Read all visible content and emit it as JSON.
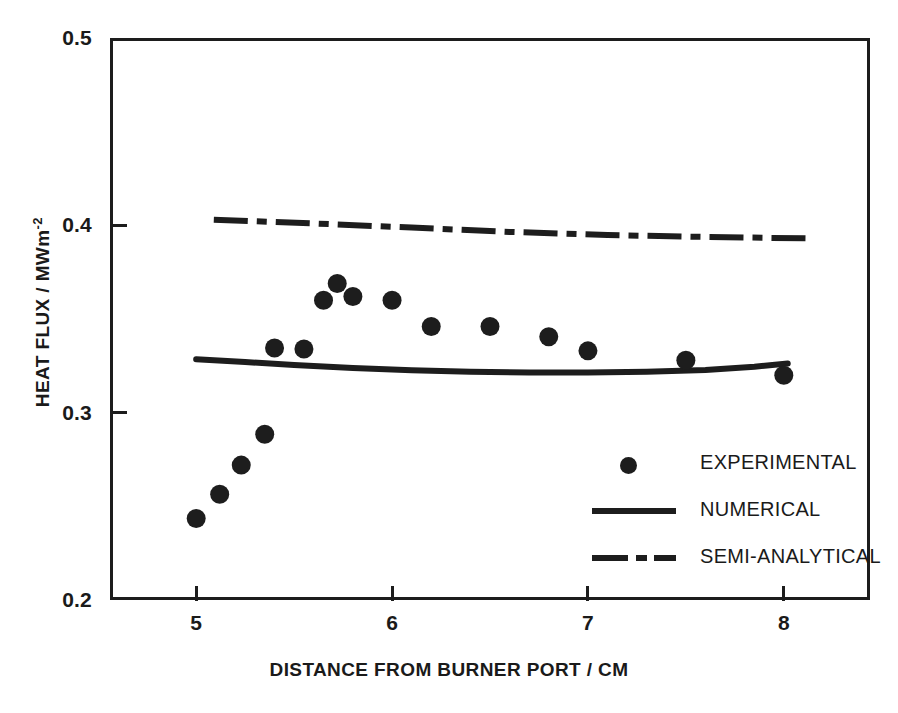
{
  "chart_data": {
    "type": "scatter",
    "title": "",
    "xlabel": "DISTANCE FROM BURNER PORT / CM",
    "ylabel": "HEAT FLUX / MWm",
    "ylabel_superscript": "-2",
    "xlim": [
      4.56,
      8.44
    ],
    "ylim": [
      0.2,
      0.5
    ],
    "xticks": [
      5,
      6,
      7,
      8
    ],
    "xtick_labels": [
      "5",
      "6",
      "7",
      "8"
    ],
    "yticks": [
      0.2,
      0.3,
      0.4,
      0.5
    ],
    "ytick_labels": [
      "0.2",
      "0.3",
      "0.4",
      "0.5"
    ],
    "grid": false,
    "legend_position": "center-right",
    "series": [
      {
        "name": "EXPERIMENTAL",
        "type": "scatter",
        "marker": "filled-circle",
        "color": "#1d1d1d",
        "x": [
          5.0,
          5.12,
          5.23,
          5.35,
          5.4,
          5.55,
          5.65,
          5.72,
          5.8,
          6.0,
          6.2,
          6.5,
          6.8,
          7.0,
          7.5,
          8.0
        ],
        "y": [
          0.2435,
          0.2565,
          0.272,
          0.2885,
          0.3345,
          0.334,
          0.36,
          0.369,
          0.362,
          0.36,
          0.346,
          0.346,
          0.3405,
          0.333,
          0.328,
          0.32
        ]
      },
      {
        "name": "NUMERICAL",
        "type": "line",
        "style": "solid",
        "color": "#1d1d1d",
        "x": [
          5.0,
          5.25,
          5.5,
          5.8,
          6.1,
          6.4,
          6.7,
          7.0,
          7.3,
          7.6,
          7.85,
          8.02
        ],
        "y": [
          0.3285,
          0.327,
          0.3255,
          0.3238,
          0.3226,
          0.3218,
          0.3214,
          0.3214,
          0.3218,
          0.3228,
          0.3245,
          0.3262
        ]
      },
      {
        "name": "SEMI-ANALYTICAL",
        "type": "line",
        "style": "dash-dot",
        "color": "#1d1d1d",
        "x": [
          5.09,
          5.6,
          6.1,
          6.6,
          7.1,
          7.6,
          8.14
        ],
        "y": [
          0.403,
          0.401,
          0.3988,
          0.3965,
          0.3948,
          0.3938,
          0.393
        ]
      }
    ]
  },
  "legend": {
    "items": [
      {
        "label": "EXPERIMENTAL",
        "key": "marker-dot"
      },
      {
        "label": "NUMERICAL",
        "key": "solid-line"
      },
      {
        "label": "SEMI-ANALYTICAL",
        "key": "dash-dot-line"
      }
    ]
  },
  "colors": {
    "ink": "#1d1d1d",
    "background": "#ffffff"
  }
}
